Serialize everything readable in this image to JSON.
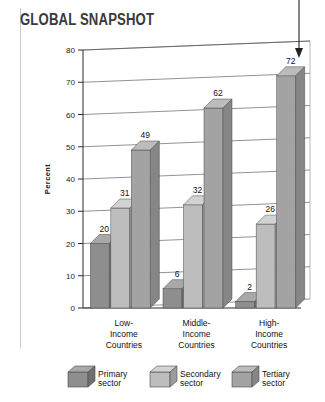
{
  "title": "GLOBAL SNAPSHOT",
  "colors": {
    "primary_sector": "#8e8e8e",
    "secondary_sector": "#bdbdbd",
    "tertiary_sector": "#a3a3a3",
    "primary_top": "#a8a8a8",
    "secondary_top": "#d2d2d2",
    "tertiary_top": "#bcbcbc",
    "primary_side": "#6f6f6f",
    "secondary_side": "#9c9c9c",
    "tertiary_side": "#868686",
    "gridline": "#4a4a4a",
    "axis": "#2b2b2b",
    "title_color": "#3a3a3a"
  },
  "legend": {
    "position": "bottom",
    "items": [
      {
        "label_line1": "Primary",
        "label_line2": "sector",
        "series": "Primary sector"
      },
      {
        "label_line1": "Secondary",
        "label_line2": "sector",
        "series": "Secondary sector"
      },
      {
        "label_line1": "Tertiary",
        "label_line2": "sector",
        "series": "Tertiary sector"
      }
    ]
  },
  "annotation": {
    "pointer": "down-arrow pointing to High-Income Countries tertiary sector bar",
    "target_value": 72
  },
  "chart_data": {
    "type": "bar",
    "title": "GLOBAL SNAPSHOT",
    "xlabel": "",
    "ylabel": "Percent",
    "ylim": [
      0,
      80
    ],
    "yticks": [
      0,
      10,
      20,
      30,
      40,
      50,
      60,
      70,
      80
    ],
    "ytick_labels": [
      "0",
      "10",
      "20",
      "30",
      "40",
      "50",
      "60",
      "70",
      "80"
    ],
    "grid": true,
    "legend_position": "bottom",
    "categories": [
      "Low-Income Countries",
      "Middle-Income Countries",
      "High-Income Countries"
    ],
    "category_lines": [
      [
        "Low-",
        "Income",
        "Countries"
      ],
      [
        "Middle-",
        "Income",
        "Countries"
      ],
      [
        "High-",
        "Income",
        "Countries"
      ]
    ],
    "series": [
      {
        "name": "Primary sector",
        "values": [
          20,
          6,
          2
        ]
      },
      {
        "name": "Secondary sector",
        "values": [
          31,
          32,
          26
        ]
      },
      {
        "name": "Tertiary sector",
        "values": [
          49,
          62,
          72
        ]
      }
    ],
    "data_labels": [
      [
        "20",
        "31",
        "49"
      ],
      [
        "6",
        "32",
        "62"
      ],
      [
        "2",
        "26",
        "72"
      ]
    ]
  }
}
